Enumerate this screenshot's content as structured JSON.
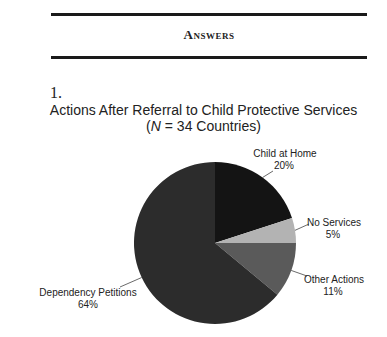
{
  "section": {
    "heading": "Answers",
    "question_number": "1."
  },
  "chart_data": {
    "type": "pie",
    "title": "Actions After Referral to Child Protective Services",
    "subtitle_prefix": "(",
    "subtitle_italic": "N",
    "subtitle_rest": " = 34 Countries)",
    "slices": [
      {
        "label": "Child at Home",
        "value": 20,
        "pct_label": "20%",
        "color": "#141414"
      },
      {
        "label": "No Services",
        "value": 5,
        "pct_label": "5%",
        "color": "#b3b3b3"
      },
      {
        "label": "Other Actions",
        "value": 11,
        "pct_label": "11%",
        "color": "#5a5a5a"
      },
      {
        "label": "Dependency Petitions",
        "value": 64,
        "pct_label": "64%",
        "color": "#2c2c2c"
      }
    ],
    "start_angle_deg": 0,
    "direction": "clockwise",
    "legend": "none (direct labels)"
  }
}
